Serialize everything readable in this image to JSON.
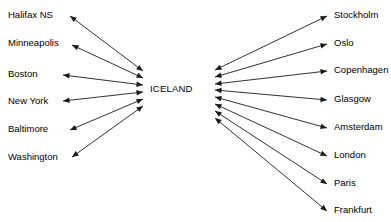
{
  "diagram": {
    "hub": {
      "label": "ICELAND",
      "x": 150,
      "y": 89
    },
    "style": {
      "line_color": "#1a1a1a",
      "text_color": "#000000",
      "background_color": "#ffffff",
      "line_width": 0.9
    },
    "left_group": {
      "name": "North America",
      "label_x": 8,
      "arrow_tip_x": 63,
      "hub_anchor_x": 143,
      "cities": [
        {
          "label": "Halifax NS",
          "label_y": 19,
          "tip_x": 70,
          "tip_y": 16,
          "hub_y": 71
        },
        {
          "label": "Minneapolis",
          "label_y": 47,
          "tip_x": 72,
          "tip_y": 45,
          "hub_y": 78
        },
        {
          "label": "Boston",
          "label_y": 78,
          "tip_x": 63,
          "tip_y": 75,
          "hub_y": 85
        },
        {
          "label": "New York",
          "label_y": 105,
          "tip_x": 63,
          "tip_y": 101,
          "hub_y": 92
        },
        {
          "label": "Baltimore",
          "label_y": 133,
          "tip_x": 70,
          "tip_y": 130,
          "hub_y": 99
        },
        {
          "label": "Washington",
          "label_y": 161,
          "tip_x": 72,
          "tip_y": 157,
          "hub_y": 106
        }
      ]
    },
    "right_group": {
      "name": "Europe",
      "label_x": 334,
      "arrow_tip_x": 327,
      "hub_anchor_x": 215,
      "cities": [
        {
          "label": "Stockholm",
          "label_y": 19,
          "tip_x": 327,
          "tip_y": 16,
          "hub_y": 70
        },
        {
          "label": "Oslo",
          "label_y": 47,
          "tip_x": 327,
          "tip_y": 44,
          "hub_y": 77
        },
        {
          "label": "Copenhagen",
          "label_y": 74,
          "tip_x": 327,
          "tip_y": 71,
          "hub_y": 84
        },
        {
          "label": "Glasgow",
          "label_y": 103,
          "tip_x": 327,
          "tip_y": 100,
          "hub_y": 90
        },
        {
          "label": "Amsterdam",
          "label_y": 131,
          "tip_x": 327,
          "tip_y": 128,
          "hub_y": 97
        },
        {
          "label": "London",
          "label_y": 159,
          "tip_x": 327,
          "tip_y": 156,
          "hub_y": 104
        },
        {
          "label": "Paris",
          "label_y": 187,
          "tip_x": 327,
          "tip_y": 184,
          "hub_y": 111
        },
        {
          "label": "Frankfurt",
          "label_y": 214,
          "tip_x": 327,
          "tip_y": 211,
          "hub_y": 118
        }
      ]
    }
  }
}
